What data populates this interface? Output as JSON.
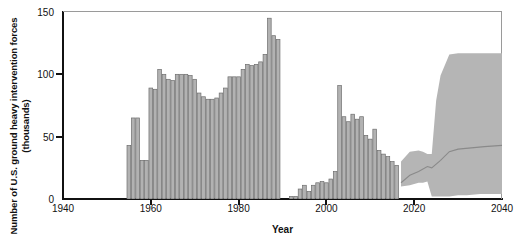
{
  "chart_data": {
    "type": "bar",
    "title": "",
    "xlabel": "Year",
    "ylabel": "Number of U.S. ground heavy intervention forces (thousands)",
    "xlim": [
      1940,
      2040
    ],
    "ylim": [
      0,
      150
    ],
    "xticks": [
      1940,
      1960,
      1980,
      2000,
      2020,
      2040
    ],
    "yticks": [
      0,
      50,
      100,
      150
    ],
    "grid": false,
    "legend": null,
    "bar_color": "#b2b2b2",
    "bar_edge_color": "#6e6e6e",
    "band_color": "#b5b5b5",
    "median_line_color": "#8a8a8a",
    "series": [
      {
        "name": "Historical heavy intervention forces",
        "type": "bar",
        "x": [
          1955,
          1956,
          1957,
          1958,
          1959,
          1960,
          1961,
          1962,
          1963,
          1964,
          1965,
          1966,
          1967,
          1968,
          1969,
          1970,
          1971,
          1972,
          1973,
          1974,
          1975,
          1976,
          1977,
          1978,
          1979,
          1980,
          1981,
          1982,
          1983,
          1984,
          1985,
          1986,
          1987,
          1988,
          1989,
          1990,
          1991,
          1992,
          1993,
          1994,
          1995,
          1996,
          1997,
          1998,
          1999,
          2000,
          2001,
          2002,
          2003,
          2004,
          2005,
          2006,
          2007,
          2008,
          2009,
          2010,
          2011,
          2012,
          2013,
          2014,
          2015,
          2016
        ],
        "values": [
          43,
          65,
          65,
          31,
          31,
          89,
          88,
          104,
          100,
          96,
          95,
          100,
          100,
          100,
          99,
          96,
          85,
          82,
          80,
          80,
          81,
          85,
          89,
          98,
          98,
          98,
          104,
          108,
          107,
          108,
          110,
          116,
          145,
          131,
          128,
          0,
          0,
          2,
          2,
          8,
          11,
          6,
          11,
          13,
          14,
          13,
          16,
          22,
          91,
          66,
          62,
          68,
          64,
          66,
          51,
          48,
          56,
          39,
          36,
          34,
          30,
          27
        ]
      },
      {
        "name": "Projected range (uncertainty band) - lower bound",
        "type": "band_lower",
        "x": [
          2017,
          2019,
          2021,
          2022,
          2023,
          2024,
          2025,
          2026,
          2028,
          2030,
          2032,
          2035,
          2040
        ],
        "values": [
          10,
          11,
          13,
          13,
          14,
          2,
          2,
          2,
          2,
          3,
          3,
          4,
          4
        ]
      },
      {
        "name": "Projected range (uncertainty band) - upper bound",
        "type": "band_upper",
        "x": [
          2017,
          2019,
          2021,
          2022,
          2023,
          2024,
          2025,
          2026,
          2028,
          2030,
          2032,
          2035,
          2040
        ],
        "values": [
          30,
          38,
          39,
          38,
          36,
          36,
          79,
          99,
          116,
          117,
          117,
          117,
          117
        ]
      },
      {
        "name": "Projected median",
        "type": "line",
        "x": [
          2017,
          2019,
          2021,
          2023,
          2024,
          2026,
          2028,
          2030,
          2033,
          2036,
          2040
        ],
        "values": [
          13,
          19,
          22,
          26,
          25,
          31,
          38,
          40,
          41,
          42,
          43
        ]
      }
    ]
  }
}
